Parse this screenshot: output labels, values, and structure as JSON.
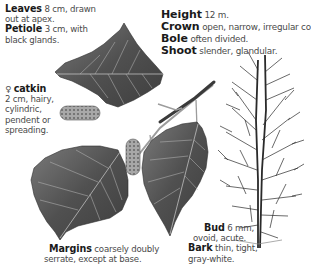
{
  "leaf": {
    "leaves": {
      "term": "Leaves",
      "desc1": "8 cm, drawn",
      "desc2": "out at apex."
    },
    "petiole": {
      "term": "Petiole",
      "desc1": "3 cm, with",
      "desc2": "black glands."
    }
  },
  "tree": {
    "height": {
      "term": "Height",
      "desc": "12 m."
    },
    "crown": {
      "term": "Crown",
      "desc": "open, narrow, irregular cone."
    },
    "bole": {
      "term": "Bole",
      "desc": "often divided."
    },
    "shoot": {
      "term": "Shoot",
      "desc": "slender, glandular."
    }
  },
  "catkin": {
    "symbol": "♀",
    "term": "catkin",
    "lines": [
      "2 cm, hairy,",
      "cylindric,",
      "pendent or",
      "spreading."
    ]
  },
  "bud": {
    "term": "Bud",
    "desc1": "6 mm,",
    "desc2": "ovoid, acute."
  },
  "bark": {
    "term": "Bark",
    "desc1": "thin, tight,",
    "desc2": "gray-white."
  },
  "margins": {
    "term": "Margins",
    "desc1": "coarsely doubly",
    "desc2": "serrate, except at base."
  },
  "illustration": {
    "leaf_color": "#5a5a5a",
    "catkin_color": "#9a9a9a",
    "twig_color": "#3a3a3a"
  }
}
